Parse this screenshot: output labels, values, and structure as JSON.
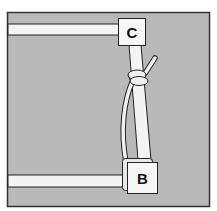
{
  "figure": {
    "type": "illustration",
    "colors": {
      "background": "#b9b9b9",
      "frame": "#333333",
      "bars": "#f4f4f4",
      "blocks": "#f7f7f7",
      "outline": "#222222"
    }
  },
  "labels": {
    "top_block": "C",
    "bottom_block": "B"
  }
}
